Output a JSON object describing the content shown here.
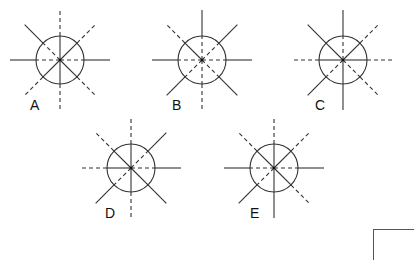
{
  "diagram": {
    "title": "",
    "style": {
      "stroke": "#333333",
      "circle_radius": 24,
      "ray_length": 50,
      "dash": "4,3"
    },
    "directions": [
      "N",
      "NE",
      "E",
      "SE",
      "S",
      "SW",
      "W",
      "NW"
    ],
    "figures": [
      {
        "label": "A",
        "cx": 60,
        "cy": 60,
        "label_x": 30,
        "label_y": 110,
        "rays": {
          "N": {
            "inner": "solid",
            "outer": "dashed"
          },
          "S": {
            "inner": "solid",
            "outer": "dashed"
          },
          "E": {
            "inner": "dashed",
            "outer": "solid"
          },
          "W": {
            "inner": "dashed",
            "outer": "solid"
          },
          "NW": {
            "inner": "dashed",
            "outer": "solid"
          },
          "SE": {
            "inner": "solid",
            "outer": "dashed"
          },
          "NE": {
            "inner": "solid",
            "outer": "dashed"
          },
          "SW": {
            "inner": "solid",
            "outer": "dashed"
          }
        }
      },
      {
        "label": "B",
        "cx": 202,
        "cy": 60,
        "label_x": 172,
        "label_y": 110,
        "rays": {
          "N": {
            "inner": "dashed",
            "outer": "solid"
          },
          "S": {
            "inner": "dashed",
            "outer": "dashed"
          },
          "E": {
            "inner": "dashed",
            "outer": "solid"
          },
          "W": {
            "inner": "dashed",
            "outer": "solid"
          },
          "NW": {
            "inner": "solid",
            "outer": "dashed"
          },
          "SE": {
            "inner": "dashed",
            "outer": "solid"
          },
          "NE": {
            "inner": "dashed",
            "outer": "solid"
          },
          "SW": {
            "inner": "dashed",
            "outer": "solid"
          }
        }
      },
      {
        "label": "C",
        "cx": 343,
        "cy": 60,
        "label_x": 315,
        "label_y": 110,
        "rays": {
          "N": {
            "inner": "dashed",
            "outer": "solid"
          },
          "S": {
            "inner": "solid",
            "outer": "solid"
          },
          "E": {
            "inner": "solid",
            "outer": "dashed"
          },
          "W": {
            "inner": "solid",
            "outer": "dashed"
          },
          "NW": {
            "inner": "solid",
            "outer": "solid"
          },
          "SE": {
            "inner": "dashed",
            "outer": "dashed"
          },
          "NE": {
            "inner": "solid",
            "outer": "dashed"
          },
          "SW": {
            "inner": "dashed",
            "outer": "solid"
          }
        }
      },
      {
        "label": "D",
        "cx": 131,
        "cy": 168,
        "label_x": 105,
        "label_y": 218,
        "rays": {
          "N": {
            "inner": "solid",
            "outer": "dashed"
          },
          "S": {
            "inner": "solid",
            "outer": "dashed"
          },
          "E": {
            "inner": "dashed",
            "outer": "solid"
          },
          "W": {
            "inner": "solid",
            "outer": "dashed"
          },
          "NW": {
            "inner": "solid",
            "outer": "dashed"
          },
          "SE": {
            "inner": "solid",
            "outer": "solid"
          },
          "NE": {
            "inner": "dashed",
            "outer": "solid"
          },
          "SW": {
            "inner": "dashed",
            "outer": "solid"
          }
        }
      },
      {
        "label": "E",
        "cx": 274,
        "cy": 168,
        "label_x": 250,
        "label_y": 218,
        "rays": {
          "N": {
            "inner": "solid",
            "outer": "dashed"
          },
          "S": {
            "inner": "solid",
            "outer": "solid"
          },
          "E": {
            "inner": "dashed",
            "outer": "solid"
          },
          "W": {
            "inner": "dashed",
            "outer": "solid"
          },
          "NW": {
            "inner": "solid",
            "outer": "dashed"
          },
          "SE": {
            "inner": "solid",
            "outer": "dashed"
          },
          "NE": {
            "inner": "solid",
            "outer": "dashed"
          },
          "SW": {
            "inner": "dashed",
            "outer": "solid"
          }
        }
      }
    ]
  }
}
